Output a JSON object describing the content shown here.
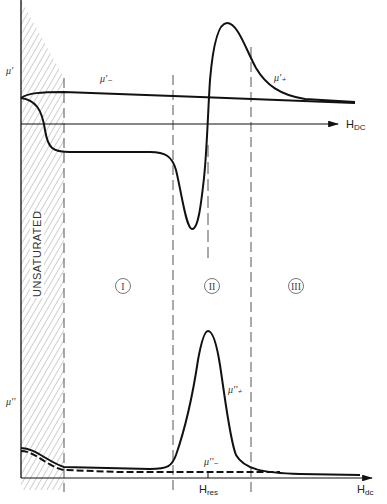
{
  "figure": {
    "type": "diagram",
    "upper_panel": {
      "y_label": "μ'",
      "x_label_main": "H",
      "x_label_sub": "DC",
      "curve_labels": {
        "minus": "μ'₋",
        "plus": "μ'₊"
      }
    },
    "lower_panel": {
      "y_label": "μ''",
      "x_label_main": "H",
      "x_label_sub": "dc",
      "resonance_label_main": "H",
      "resonance_label_sub": "res",
      "curve_labels": {
        "plus": "μ''₊",
        "minus": "μ''₋"
      }
    },
    "regions": {
      "unsaturated": "UNSATURATED",
      "r1": "I",
      "r2": "II",
      "r3": "III"
    },
    "colors": {
      "line": "#111111",
      "hatch": "#777777",
      "dashed": "#555555",
      "background": "#ffffff"
    }
  }
}
